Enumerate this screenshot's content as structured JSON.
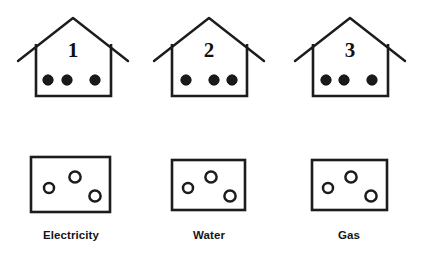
{
  "figure": {
    "background_color": "#ffffff",
    "stroke_color": "#1c1c1c",
    "dot_fill_color": "#1a1a1a",
    "circle_fill_color": "#ffffff"
  },
  "houses": [
    {
      "number": "1",
      "number_x": 73,
      "number_y": 57,
      "wall_left": 36,
      "wall_right": 111,
      "wall_top": 44,
      "wall_bottom": 96,
      "roof_peak_x": 73,
      "roof_peak_y": 18,
      "roof_left_x": 18,
      "roof_left_y": 61,
      "roof_right_x": 128,
      "roof_right_y": 61,
      "dots": [
        {
          "cx": 48,
          "cy": 80,
          "r": 5.2
        },
        {
          "cx": 67,
          "cy": 80,
          "r": 5.2
        },
        {
          "cx": 95,
          "cy": 80,
          "r": 5.2
        }
      ]
    },
    {
      "number": "2",
      "number_x": 209,
      "number_y": 57,
      "wall_left": 172,
      "wall_right": 247,
      "wall_top": 44,
      "wall_bottom": 96,
      "roof_peak_x": 209,
      "roof_peak_y": 18,
      "roof_left_x": 154,
      "roof_left_y": 61,
      "roof_right_x": 264,
      "roof_right_y": 61,
      "dots": [
        {
          "cx": 186,
          "cy": 80,
          "r": 5.2
        },
        {
          "cx": 214,
          "cy": 80,
          "r": 5.2
        },
        {
          "cx": 232,
          "cy": 80,
          "r": 5.2
        }
      ]
    },
    {
      "number": "3",
      "number_x": 350,
      "number_y": 57,
      "wall_left": 313,
      "wall_right": 388,
      "wall_top": 44,
      "wall_bottom": 96,
      "roof_peak_x": 350,
      "roof_peak_y": 18,
      "roof_left_x": 295,
      "roof_left_y": 61,
      "roof_right_x": 405,
      "roof_right_y": 61,
      "dots": [
        {
          "cx": 326,
          "cy": 80,
          "r": 5.2
        },
        {
          "cx": 344,
          "cy": 80,
          "r": 5.2
        },
        {
          "cx": 372,
          "cy": 80,
          "r": 5.2
        }
      ]
    }
  ],
  "utilities": [
    {
      "label": "Electricity",
      "label_x": 71,
      "label_y": 239,
      "box_x": 31,
      "box_y": 157,
      "box_width": 79,
      "box_height": 55,
      "circles": [
        {
          "cx": 49,
          "cy": 188,
          "r": 5.0
        },
        {
          "cx": 75,
          "cy": 177,
          "r": 5.6
        },
        {
          "cx": 95,
          "cy": 196,
          "r": 5.6
        }
      ]
    },
    {
      "label": "Water",
      "label_x": 209,
      "label_y": 239,
      "box_x": 172,
      "box_y": 160,
      "box_width": 73,
      "box_height": 50,
      "circles": [
        {
          "cx": 188,
          "cy": 188,
          "r": 5.0
        },
        {
          "cx": 211,
          "cy": 177,
          "r": 5.6
        },
        {
          "cx": 230,
          "cy": 196,
          "r": 5.6
        }
      ]
    },
    {
      "label": "Gas",
      "label_x": 349,
      "label_y": 239,
      "box_x": 312,
      "box_y": 160,
      "box_width": 75,
      "box_height": 50,
      "circles": [
        {
          "cx": 328,
          "cy": 188,
          "r": 5.0
        },
        {
          "cx": 351,
          "cy": 177,
          "r": 5.6
        },
        {
          "cx": 371,
          "cy": 196,
          "r": 5.6
        }
      ]
    }
  ]
}
